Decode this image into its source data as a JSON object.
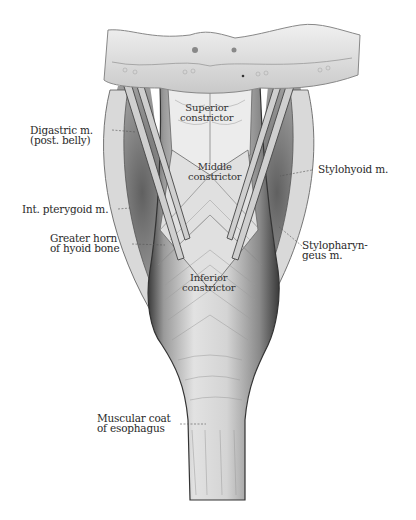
{
  "figure": {
    "colors": {
      "background": "#ffffff",
      "bone": "#e4e4e4",
      "muscle_light": "#e9e9e9",
      "muscle_mid": "#bdbdbd",
      "muscle_dark": "#4a4a4a",
      "label_text": "#2a2a2a"
    }
  },
  "labels": {
    "superior_constrictor": [
      "Superior",
      "constrictor"
    ],
    "middle_constrictor": [
      "Middle",
      "constrictor"
    ],
    "inferior_constrictor": [
      "Inferior",
      "constrictor"
    ],
    "digastric": [
      "Digastric m.",
      "(post. belly)"
    ],
    "stylohyoid": [
      "Stylohyoid m."
    ],
    "int_pterygoid": [
      "Int. pterygoid m."
    ],
    "greater_horn": [
      "Greater horn",
      "of hyoid bone"
    ],
    "stylopharyngeus": [
      "Stylopharyn-",
      "geus m."
    ],
    "esophagus": [
      "Muscular coat",
      "of esophagus"
    ]
  }
}
